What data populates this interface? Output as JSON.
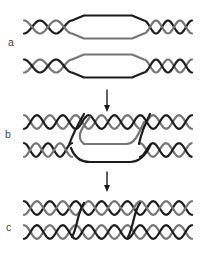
{
  "figure": {
    "background": "#ffffff",
    "colors": {
      "strand_dark": "#1c1c1c",
      "strand_gray": "#757575",
      "arrow": "#1c1c1c",
      "label_text": "#444444"
    },
    "panels": [
      {
        "label": "a",
        "content": "two-dna-duplexes-each-with-open-single-strand-bubble"
      },
      {
        "label": "b",
        "content": "strand-exchange-intermediate-with-displaced-strand-loops"
      },
      {
        "label": "c",
        "content": "recombined-duplexes-joined-by-two-strand-crossovers"
      }
    ],
    "arrows": [
      {
        "icon": "down-arrow-icon"
      },
      {
        "icon": "down-arrow-icon"
      }
    ]
  }
}
